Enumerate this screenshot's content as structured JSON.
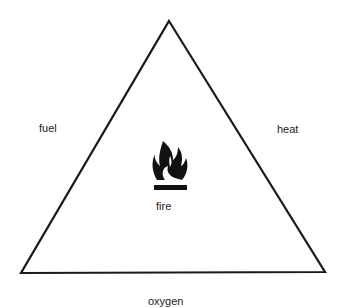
{
  "diagram": {
    "stroke_color": "#1a1a1a",
    "text_color": "#222222",
    "sides": {
      "left": "fuel",
      "right": "heat",
      "bottom": "oxygen"
    },
    "center": {
      "icon": "flame-icon",
      "label": "fire"
    }
  }
}
